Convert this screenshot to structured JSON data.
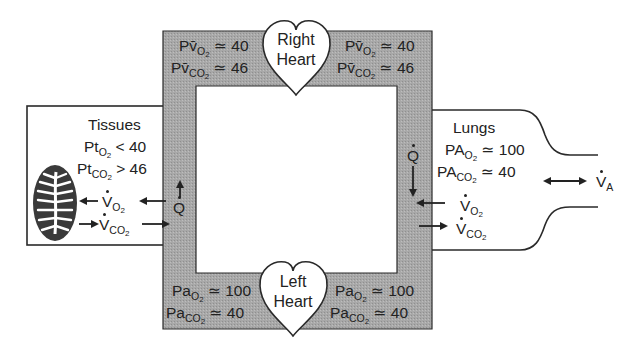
{
  "diagram": {
    "type": "gas-exchange-circuit",
    "colors": {
      "frame_fill": "#a9a9a9",
      "stroke": "#2a2a2a",
      "mitochondrion": "#3a3a3a",
      "background": "#ffffff"
    }
  },
  "right_heart": {
    "label_line1": "Right",
    "label_line2": "Heart",
    "left_values": {
      "pvO2_label": "Pv̄",
      "pvO2_sub": "O",
      "pvO2_subsub": "2",
      "pvO2_value": "≃ 40",
      "pvCO2_label": "Pv̄",
      "pvCO2_sub": "CO",
      "pvCO2_subsub": "2",
      "pvCO2_value": "≃ 46"
    },
    "right_values": {
      "pvO2_label": "Pv̄",
      "pvO2_sub": "O",
      "pvO2_subsub": "2",
      "pvO2_value": "≃ 40",
      "pvCO2_label": "Pv̄",
      "pvCO2_sub": "CO",
      "pvCO2_subsub": "2",
      "pvCO2_value": "≃ 46"
    }
  },
  "left_heart": {
    "label_line1": "Left",
    "label_line2": "Heart",
    "left_values": {
      "paO2_label": "Pa",
      "paO2_sub": "O",
      "paO2_subsub": "2",
      "paO2_value": "≃ 100",
      "paCO2_label": "Pa",
      "paCO2_sub": "CO",
      "paCO2_subsub": "2",
      "paCO2_value": "≃ 40"
    },
    "right_values": {
      "paO2_label": "Pa",
      "paO2_sub": "O",
      "paO2_subsub": "2",
      "paO2_value": "≃ 100",
      "paCO2_label": "Pa",
      "paCO2_sub": "CO",
      "paCO2_subsub": "2",
      "paCO2_value": "≃ 40"
    }
  },
  "tissues": {
    "title": "Tissues",
    "ptO2_label": "Pt",
    "ptO2_sub": "O",
    "ptO2_subsub": "2",
    "ptO2_value": "< 40",
    "ptCO2_label": "Pt",
    "ptCO2_sub": "CO",
    "ptCO2_subsub": "2",
    "ptCO2_value": "> 46",
    "vo2_label": "V",
    "vo2_sub": "O",
    "vo2_subsub": "2",
    "vco2_label": "V",
    "vco2_sub": "CO",
    "vco2_subsub": "2",
    "flow_label": "Q",
    "icon": "mitochondrion-icon"
  },
  "lungs": {
    "title": "Lungs",
    "paO2_label": "PA",
    "paO2_sub": "O",
    "paO2_subsub": "2",
    "paO2_value": "≃ 100",
    "paCO2_label": "PA",
    "paCO2_sub": "CO",
    "paCO2_subsub": "2",
    "paCO2_value": "≃ 40",
    "vo2_label": "V",
    "vo2_sub": "O",
    "vo2_subsub": "2",
    "vco2_label": "V",
    "vco2_sub": "CO",
    "vco2_subsub": "2",
    "flow_label": "Q",
    "ventilation_label": "V",
    "ventilation_sub": "A"
  }
}
